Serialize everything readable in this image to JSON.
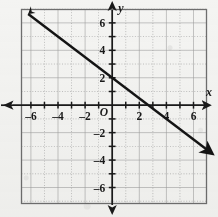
{
  "chart_data": {
    "type": "line",
    "title": "",
    "xlabel": "x",
    "ylabel": "y",
    "origin_label": "O",
    "xlim": [
      -7,
      7
    ],
    "ylim": [
      -7,
      7
    ],
    "grid": true,
    "grid_step": 1,
    "x_ticks": [
      -6,
      -4,
      -2,
      2,
      4,
      6
    ],
    "y_ticks": [
      6,
      4,
      2,
      -2,
      -4,
      -6
    ],
    "x_tick_labels": [
      "–6",
      "–4",
      "–2",
      "2",
      "4",
      "6"
    ],
    "y_tick_labels": [
      "6",
      "4",
      "2",
      "–2",
      "–4",
      "–6"
    ],
    "series": [
      {
        "name": "line",
        "equation": "y = -0.75x + 2",
        "slope": -0.75,
        "intercept": 2,
        "x_intercept": 2.667,
        "arrows": "both",
        "points": [
          {
            "x": -6.2,
            "y": 6.65
          },
          {
            "x": -4,
            "y": 5
          },
          {
            "x": -2,
            "y": 3.5
          },
          {
            "x": 0,
            "y": 2
          },
          {
            "x": 2,
            "y": 0.5
          },
          {
            "x": 4,
            "y": -1
          },
          {
            "x": 6,
            "y": -2.5
          },
          {
            "x": 7.0,
            "y": -3.25
          }
        ]
      }
    ],
    "colors": {
      "axis": "#1a1a1a",
      "line": "#141414",
      "grid": "#9a9a9a",
      "frame": "#6e6e6e",
      "background": "#f4f4f2"
    }
  }
}
